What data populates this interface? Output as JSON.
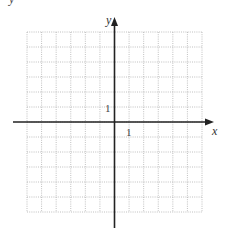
{
  "diagram": {
    "type": "coordinate-grid",
    "x_axis_label": "x",
    "y_axis_label": "y",
    "x_tick_label": "1",
    "y_tick_label": "1",
    "grid": {
      "columns": 12,
      "rows": 12,
      "x_range": [
        -6,
        6
      ],
      "y_range": [
        -6,
        6
      ],
      "line_style": "dotted",
      "line_color": "#b0b0b0"
    },
    "axis_color": "#222222",
    "top_left_fragment": "y"
  }
}
